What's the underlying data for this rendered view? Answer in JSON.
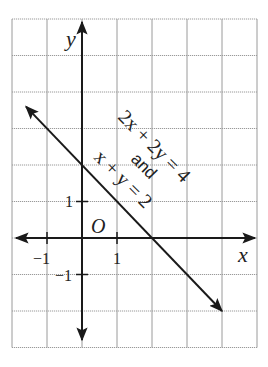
{
  "chart_data": {
    "type": "line",
    "title": "",
    "xlabel": "x",
    "ylabel": "y",
    "origin_label": "O",
    "xlim": [
      -2,
      5
    ],
    "ylim": [
      -3,
      6
    ],
    "grid": true,
    "x_tick_labels": [
      {
        "value": -1,
        "label": "−1"
      },
      {
        "value": 1,
        "label": "1"
      }
    ],
    "y_tick_labels": [
      {
        "value": 1,
        "label": "1"
      },
      {
        "value": -1,
        "label": "−1"
      }
    ],
    "series": [
      {
        "name": "2x + 2y = 4 and x + y = 2",
        "equation": "y = 2 - x",
        "x": [
          -1.6,
          0,
          1,
          2,
          4
        ],
        "y": [
          3.6,
          2,
          1,
          0,
          -2
        ],
        "arrows": "both"
      }
    ],
    "annotations": [
      {
        "text": "2x + 2y = 4",
        "rotation": 45
      },
      {
        "text": "and",
        "rotation": 45
      },
      {
        "text": "x + y = 2",
        "rotation": 45
      }
    ]
  },
  "colors": {
    "grid": "#9a9a9a",
    "axis": "#1a1a1a",
    "line": "#1a1a1a",
    "text": "#222222"
  }
}
